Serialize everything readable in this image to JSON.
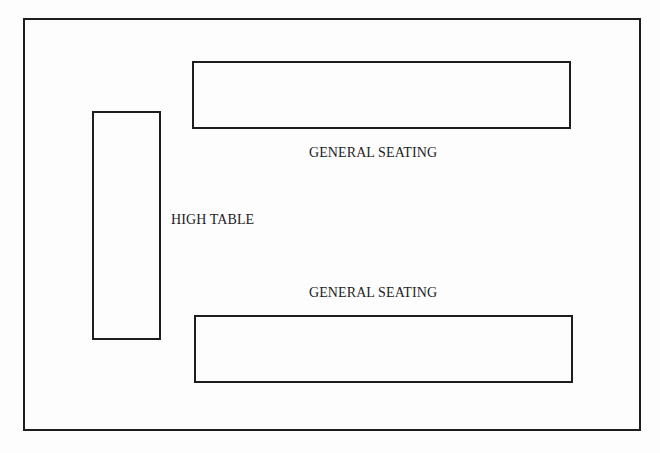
{
  "diagram": {
    "type": "seating-plan",
    "colors": {
      "line": "#1e1e1e",
      "text": "#222222",
      "background": "#fdfdfd"
    },
    "room": {
      "label": ""
    },
    "tables": [
      {
        "id": "general-seating-top",
        "label": "GENERAL SEATING",
        "orientation": "horizontal"
      },
      {
        "id": "high-table",
        "label": "HIGH TABLE",
        "orientation": "vertical"
      },
      {
        "id": "general-seating-bottom",
        "label": "GENERAL SEATING",
        "orientation": "horizontal"
      }
    ]
  }
}
